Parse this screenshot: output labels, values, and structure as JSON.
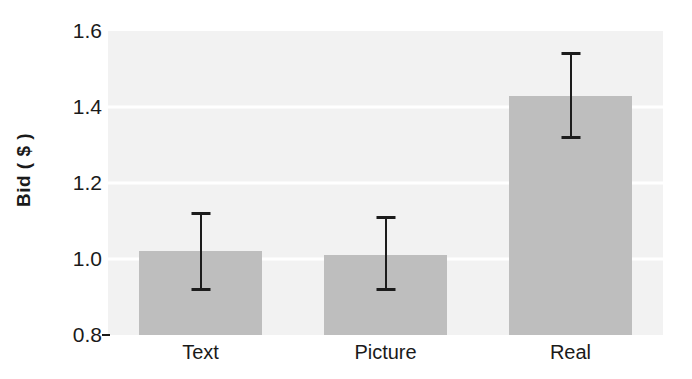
{
  "chart_data": {
    "type": "bar",
    "title": "",
    "subtitle": "",
    "xlabel": "",
    "ylabel": "Bid ( $ )",
    "categories": [
      "Text",
      "Picture",
      "Real"
    ],
    "values": [
      1.02,
      1.01,
      1.43
    ],
    "errors_upper": [
      1.12,
      1.11,
      1.54
    ],
    "errors_lower": [
      0.92,
      0.92,
      1.32
    ],
    "ylim": [
      0.8,
      1.6
    ],
    "ytick_labels": [
      "1.6",
      "1.4",
      "1.2",
      "1.0",
      "0.8"
    ],
    "ytick_values": [
      1.6,
      1.4,
      1.2,
      1.0,
      0.8
    ],
    "grid": true,
    "grid_values": [
      1.4,
      1.2,
      1.0
    ],
    "legend": null,
    "legend_position": "none",
    "series": [
      {
        "name": "Bid",
        "values": [
          1.02,
          1.01,
          1.43
        ],
        "error_upper": [
          1.12,
          1.11,
          1.54
        ],
        "error_lower": [
          0.92,
          0.92,
          1.32
        ]
      }
    ],
    "colors": {
      "bar_fill": "#bebebe",
      "plot_background": "#f2f2f2",
      "gridline": "#ffffff",
      "error_bar": "#1c1c1c",
      "text": "#1a1a1a"
    }
  }
}
